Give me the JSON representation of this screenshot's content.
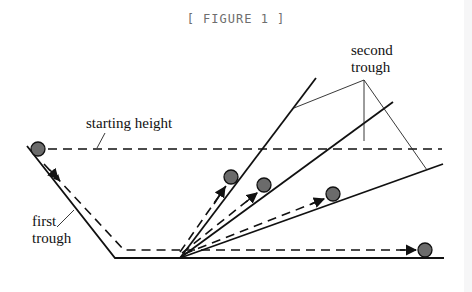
{
  "caption": "[ FIGURE 1 ]",
  "labels": {
    "starting_height": "starting height",
    "first_trough_line1": "first",
    "first_trough_line2": "trough",
    "second_trough_line1": "second",
    "second_trough_line2": "trough"
  },
  "colors": {
    "background": "#ffffff",
    "line": "#111111",
    "ball_fill": "#6b6b6b",
    "caption": "#6e6e6e"
  },
  "geometry": {
    "pivot": [
      180,
      258
    ],
    "left_slope": [
      [
        27,
        146
      ],
      [
        115,
        258
      ]
    ],
    "bottom_line": [
      [
        115,
        258
      ],
      [
        444,
        258
      ]
    ],
    "starting_height_y": 149,
    "ramps": [
      {
        "name": "steep",
        "end": [
          316,
          78
        ]
      },
      {
        "name": "medium",
        "end": [
          393,
          102
        ]
      },
      {
        "name": "shallow",
        "end": [
          443,
          164
        ]
      }
    ],
    "balls": [
      {
        "name": "start",
        "center": [
          38,
          149
        ]
      },
      {
        "name": "steep-ramp",
        "center": [
          231,
          177
        ]
      },
      {
        "name": "medium-ramp",
        "center": [
          264,
          185
        ]
      },
      {
        "name": "shallow-ramp",
        "center": [
          333,
          194
        ]
      },
      {
        "name": "flat",
        "center": [
          425,
          250
        ]
      }
    ]
  }
}
